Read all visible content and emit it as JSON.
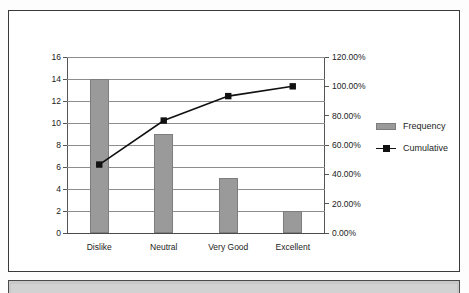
{
  "chart_data": {
    "type": "bar",
    "title": "",
    "subtitle": "",
    "xlabel": "",
    "ylabel": "",
    "categories": [
      "Dislike",
      "Neutral",
      "Very Good",
      "Excellent"
    ],
    "series": [
      {
        "name": "Frequency",
        "type": "bar",
        "axis": "left",
        "values": [
          14,
          9,
          5,
          2
        ],
        "color": "#9a9a9a"
      },
      {
        "name": "Cumulative",
        "type": "line",
        "axis": "right",
        "values": [
          46.67,
          76.67,
          93.33,
          100.0
        ],
        "value_labels": [
          "46.67%",
          "76.67%",
          "93.33%",
          "100.00%"
        ],
        "color": "#111111",
        "marker": "square"
      }
    ],
    "left_axis": {
      "min": 0,
      "max": 16,
      "step": 2,
      "ticks": [
        0,
        2,
        4,
        6,
        8,
        10,
        12,
        14,
        16
      ],
      "tick_labels": [
        "0",
        "2",
        "4",
        "6",
        "8",
        "10",
        "12",
        "14",
        "16"
      ]
    },
    "right_axis": {
      "min": 0,
      "max": 120,
      "step": 20,
      "ticks": [
        0,
        20,
        40,
        60,
        80,
        100,
        120
      ],
      "tick_labels": [
        "0.00%",
        "20.00%",
        "40.00%",
        "60.00%",
        "80.00%",
        "100.00%",
        "120.00%"
      ]
    },
    "grid": true,
    "legend_position": "right",
    "legend": [
      "Frequency",
      "Cumulative"
    ]
  },
  "legend": {
    "items": [
      {
        "label": "Frequency",
        "swatch": "bar-swatch"
      },
      {
        "label": "Cumulative",
        "swatch": "line-marker-swatch"
      }
    ]
  }
}
